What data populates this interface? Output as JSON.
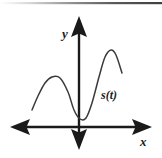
{
  "figure": {
    "kind": "math-graph",
    "width": 162,
    "height": 158,
    "background_color": "#ffffff",
    "ink_color": "#1a1a1a",
    "curve_color": "#3a3a3a",
    "top_rule_color": "#4a4a4a"
  },
  "labels": {
    "y_axis": "y",
    "x_axis": "x",
    "curve": "s(t)"
  },
  "chart_data": {
    "type": "line",
    "title": "",
    "xlabel": "x",
    "ylabel": "y",
    "legend": [
      "s(t)"
    ],
    "grid": false,
    "axes_style": "double-headed-arrows",
    "origin_px": {
      "x": 79,
      "y": 127
    },
    "annotations": [
      {
        "text": "y",
        "x_px": 62,
        "y_px": 38
      },
      {
        "text": "x",
        "x_px": 140,
        "y_px": 146
      },
      {
        "text": "s(t)",
        "x_px": 101,
        "y_px": 99
      }
    ],
    "series": [
      {
        "name": "s(t)",
        "points_px": [
          [
            32,
            110
          ],
          [
            38,
            96
          ],
          [
            45,
            83
          ],
          [
            52,
            77
          ],
          [
            60,
            78
          ],
          [
            68,
            92
          ],
          [
            74,
            110
          ],
          [
            80,
            119
          ],
          [
            86,
            118
          ],
          [
            92,
            103
          ],
          [
            99,
            77
          ],
          [
            105,
            57
          ],
          [
            111,
            50
          ],
          [
            116,
            55
          ],
          [
            122,
            73
          ]
        ],
        "shape_description": "rises to a local maximum left of the y-axis, falls to a local minimum just right of the y-axis near the x-axis, then rises to a higher maximum and falls off"
      }
    ],
    "features": [
      {
        "type": "local-maximum",
        "label": "left hump",
        "x_px": 52,
        "y_px": 77
      },
      {
        "type": "local-minimum",
        "label": "trough near origin",
        "x_px": 80,
        "y_px": 119
      },
      {
        "type": "local-maximum",
        "label": "right hump",
        "x_px": 111,
        "y_px": 50
      }
    ]
  },
  "axes": {
    "x_axis": {
      "start_px": {
        "x": 10,
        "y": 127
      },
      "end_px": {
        "x": 152,
        "y": 127
      },
      "arrowheads": "both"
    },
    "y_axis": {
      "start_px": {
        "x": 79,
        "y": 150
      },
      "end_px": {
        "x": 79,
        "y": 16
      },
      "arrowheads": "both"
    }
  },
  "top_rule": {
    "present": true,
    "y_px": 3,
    "from_px": 0,
    "to_px": 162
  }
}
